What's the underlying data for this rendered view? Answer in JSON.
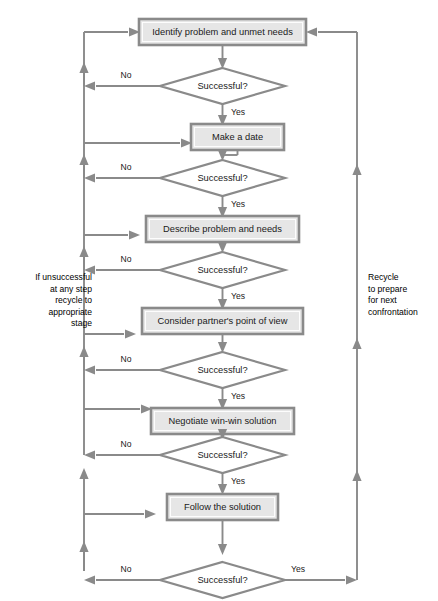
{
  "diagram": {
    "type": "flowchart",
    "title": "",
    "colors": {
      "box_fill": "#e6e6e6",
      "box_stroke": "#8a8a8a",
      "diamond_fill": "#ffffff",
      "diamond_stroke": "#8a8a8a",
      "line": "#8a8a8a",
      "text": "#1a1a1a",
      "background": "#ffffff"
    },
    "process_steps": [
      {
        "id": "step-1",
        "label": "Identify problem and unmet needs"
      },
      {
        "id": "step-2",
        "label": "Make a date"
      },
      {
        "id": "step-3",
        "label": "Describe problem and needs"
      },
      {
        "id": "step-4",
        "label": "Consider partner's point of view"
      },
      {
        "id": "step-5",
        "label": "Negotiate win-win solution"
      },
      {
        "id": "step-6",
        "label": "Follow the solution"
      }
    ],
    "decisions": [
      {
        "id": "decision-1",
        "label": "Successful?"
      },
      {
        "id": "decision-2",
        "label": "Successful?"
      },
      {
        "id": "decision-3",
        "label": "Successful?"
      },
      {
        "id": "decision-4",
        "label": "Successful?"
      },
      {
        "id": "decision-5",
        "label": "Successful?"
      },
      {
        "id": "decision-6",
        "label": "Successful?"
      }
    ],
    "edge_labels": {
      "no": "No",
      "yes": "Yes"
    },
    "decision_branches": [
      {
        "decision": "decision-1",
        "no": "No",
        "yes": "Yes"
      },
      {
        "decision": "decision-2",
        "no": "No",
        "yes": "Yes"
      },
      {
        "decision": "decision-3",
        "no": "No",
        "yes": "Yes"
      },
      {
        "decision": "decision-4",
        "no": "No",
        "yes": "Yes"
      },
      {
        "decision": "decision-5",
        "no": "No",
        "yes": "Yes"
      },
      {
        "decision": "decision-6",
        "no": "No",
        "yes": "Yes"
      }
    ],
    "annotations": {
      "left_note_lines": [
        "If unsuccessful",
        "at any step",
        "recycle to",
        "appropriate",
        "stage"
      ],
      "left_note_text": "If unsuccessful at any step recycle to appropriate stage",
      "right_note_lines": [
        "Recycle",
        "to  prepare",
        "for next",
        "confrontation"
      ],
      "right_note_text": "Recycle to prepare for next confrontation"
    }
  }
}
